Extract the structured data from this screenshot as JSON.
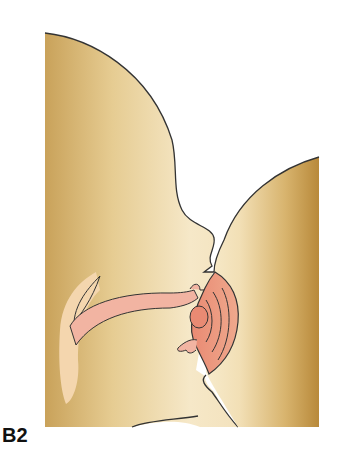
{
  "figure": {
    "panel_label": "B2",
    "colors": {
      "infant_skin_light": "#f6e7c4",
      "infant_skin_dark": "#c9a25a",
      "breast_light": "#f5e6c2",
      "breast_dark": "#b8893a",
      "nipple_areola": "#e9917a",
      "tongue": "#f2b4a2",
      "palate_highlight": "#f4d6ae",
      "outline": "#333333",
      "background": "#ffffff"
    }
  }
}
